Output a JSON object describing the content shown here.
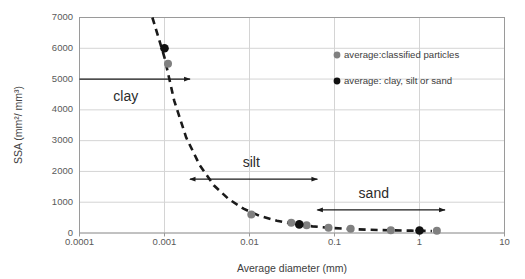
{
  "chart_data": {
    "type": "scatter",
    "title": "",
    "xlabel": "Average diameter (mm)",
    "ylabel": "SSA (mm²/ mm³)",
    "xscale": "log",
    "xlim": [
      0.0001,
      10
    ],
    "ylim": [
      0,
      7000
    ],
    "xticks": [
      "0.0001",
      "0.001",
      "0.01",
      "0.1",
      "1",
      "10"
    ],
    "xtick_values": [
      0.0001,
      0.001,
      0.01,
      0.1,
      1,
      10
    ],
    "yticks": [
      "0",
      "1000",
      "2000",
      "3000",
      "4000",
      "5000",
      "6000",
      "7000"
    ],
    "ytick_values": [
      0,
      1000,
      2000,
      3000,
      4000,
      5000,
      6000,
      7000
    ],
    "grid": "horizontal",
    "legend_position": "top-right-inside",
    "series": [
      {
        "name": "average:classified particles",
        "marker": "circle",
        "color": "#808080",
        "points": [
          {
            "x": 0.0011,
            "y": 5500
          },
          {
            "x": 0.0105,
            "y": 600
          },
          {
            "x": 0.031,
            "y": 330
          },
          {
            "x": 0.047,
            "y": 250
          },
          {
            "x": 0.085,
            "y": 170
          },
          {
            "x": 0.155,
            "y": 140
          },
          {
            "x": 0.46,
            "y": 90
          },
          {
            "x": 1.6,
            "y": 70
          }
        ]
      },
      {
        "name": "average: clay, silt or sand",
        "marker": "circle",
        "color": "#111111",
        "points": [
          {
            "x": 0.001,
            "y": 6000
          },
          {
            "x": 0.0385,
            "y": 280
          },
          {
            "x": 1.0,
            "y": 80
          }
        ]
      }
    ],
    "trend_curve": {
      "style": "dashed",
      "description": "power-law decay fitted through averages",
      "points": [
        {
          "x": 0.00072,
          "y": 7000
        },
        {
          "x": 0.001,
          "y": 5700
        },
        {
          "x": 0.0013,
          "y": 4300
        },
        {
          "x": 0.0018,
          "y": 3100
        },
        {
          "x": 0.0026,
          "y": 2200
        },
        {
          "x": 0.0038,
          "y": 1550
        },
        {
          "x": 0.0057,
          "y": 1100
        },
        {
          "x": 0.0085,
          "y": 790
        },
        {
          "x": 0.013,
          "y": 560
        },
        {
          "x": 0.021,
          "y": 400
        },
        {
          "x": 0.034,
          "y": 290
        },
        {
          "x": 0.055,
          "y": 215
        },
        {
          "x": 0.09,
          "y": 165
        },
        {
          "x": 0.15,
          "y": 130
        },
        {
          "x": 0.26,
          "y": 105
        },
        {
          "x": 0.45,
          "y": 88
        },
        {
          "x": 0.8,
          "y": 76
        },
        {
          "x": 1.4,
          "y": 66
        }
      ]
    },
    "annotations": [
      {
        "label": "clay",
        "label_x": 0.00035,
        "label_y": 4300,
        "arrow_y": 5000,
        "arrow_from_x": 0.0001,
        "arrow_to_x": 0.002,
        "arrow_heads": "right"
      },
      {
        "label": "silt",
        "label_x": 0.0105,
        "label_y": 2150,
        "arrow_y": 1750,
        "arrow_from_x": 0.002,
        "arrow_to_x": 0.063,
        "arrow_heads": "both"
      },
      {
        "label": "sand",
        "label_x": 0.29,
        "label_y": 1140,
        "arrow_y": 750,
        "arrow_from_x": 0.063,
        "arrow_to_x": 2.0,
        "arrow_heads": "both"
      }
    ]
  },
  "legend": {
    "entries": [
      {
        "label": "average:classified particles",
        "color": "#808080"
      },
      {
        "label": "average: clay, silt or sand",
        "color": "#111111"
      }
    ]
  }
}
